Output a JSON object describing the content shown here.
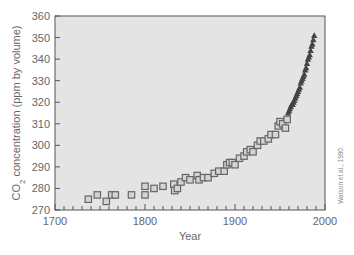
{
  "chart_data": {
    "type": "scatter",
    "title": "",
    "xlabel": "Year",
    "ylabel": "CO2 concentration (ppm by volume)",
    "ylabel_parts": {
      "pre": "CO",
      "sub": "2",
      "post": " concentration (ppm by volume)"
    },
    "xlim": [
      1700,
      2000
    ],
    "ylim": [
      270,
      360
    ],
    "xticks": [
      1700,
      1800,
      1900,
      2000
    ],
    "yticks": [
      270,
      280,
      290,
      300,
      310,
      320,
      330,
      340,
      350,
      360
    ],
    "x_minor_step": 10,
    "grid": false,
    "plot_background": "#e4e4e4",
    "credit": "Watson et al., 1990.",
    "series": [
      {
        "name": "Ice core data",
        "marker": "square",
        "color": "#666666",
        "points": [
          [
            1737,
            275
          ],
          [
            1747,
            277
          ],
          [
            1757,
            274
          ],
          [
            1763,
            277
          ],
          [
            1767,
            277
          ],
          [
            1785,
            277
          ],
          [
            1800,
            277
          ],
          [
            1800,
            281
          ],
          [
            1810,
            280
          ],
          [
            1820,
            281
          ],
          [
            1832,
            282
          ],
          [
            1833,
            279
          ],
          [
            1836,
            280
          ],
          [
            1840,
            283
          ],
          [
            1845,
            285
          ],
          [
            1850,
            284
          ],
          [
            1858,
            286
          ],
          [
            1860,
            284
          ],
          [
            1865,
            285
          ],
          [
            1870,
            285
          ],
          [
            1877,
            287
          ],
          [
            1882,
            288
          ],
          [
            1888,
            288
          ],
          [
            1891,
            291
          ],
          [
            1894,
            292
          ],
          [
            1897,
            292
          ],
          [
            1900,
            291
          ],
          [
            1905,
            294
          ],
          [
            1910,
            295
          ],
          [
            1913,
            297
          ],
          [
            1917,
            298
          ],
          [
            1920,
            297
          ],
          [
            1925,
            300
          ],
          [
            1928,
            302
          ],
          [
            1932,
            302
          ],
          [
            1937,
            303
          ],
          [
            1940,
            305
          ],
          [
            1945,
            305
          ],
          [
            1948,
            309
          ],
          [
            1950,
            311
          ],
          [
            1953,
            310
          ],
          [
            1956,
            308
          ],
          [
            1958,
            312
          ]
        ]
      },
      {
        "name": "Mauna Loa direct measurement",
        "marker": "triangle",
        "color": "#444444",
        "points": [
          [
            1959,
            315
          ],
          [
            1960,
            316
          ],
          [
            1961,
            317
          ],
          [
            1962,
            318
          ],
          [
            1963,
            319
          ],
          [
            1964,
            319
          ],
          [
            1965,
            320
          ],
          [
            1966,
            321
          ],
          [
            1967,
            322
          ],
          [
            1968,
            323
          ],
          [
            1969,
            324
          ],
          [
            1970,
            325
          ],
          [
            1971,
            326
          ],
          [
            1972,
            327
          ],
          [
            1973,
            329
          ],
          [
            1974,
            330
          ],
          [
            1975,
            331
          ],
          [
            1976,
            332
          ],
          [
            1977,
            333
          ],
          [
            1978,
            335
          ],
          [
            1979,
            336
          ],
          [
            1980,
            338
          ],
          [
            1981,
            340
          ],
          [
            1982,
            341
          ],
          [
            1983,
            342
          ],
          [
            1984,
            344
          ],
          [
            1985,
            346
          ],
          [
            1986,
            347
          ],
          [
            1987,
            349
          ],
          [
            1988,
            351
          ]
        ]
      }
    ]
  }
}
